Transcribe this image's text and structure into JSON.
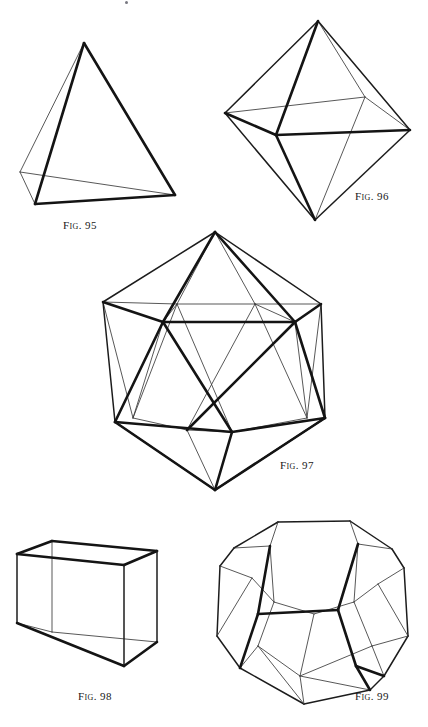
{
  "page": {
    "background_color": "#ffffff",
    "ink_color": "#141414",
    "width": 428,
    "height": 727,
    "medium": "line-engraving"
  },
  "figures": [
    {
      "id": "fig-95",
      "caption": "FIG. 95",
      "caption_prefix": "Fig.",
      "caption_number": "95",
      "solid_name": "tetrahedron",
      "faces": 4,
      "edges": 6,
      "vertices": 4,
      "face_polygon": "triangle"
    },
    {
      "id": "fig-96",
      "caption": "FIG. 96",
      "caption_prefix": "Fig.",
      "caption_number": "96",
      "solid_name": "octahedron",
      "faces": 8,
      "edges": 12,
      "vertices": 6,
      "face_polygon": "triangle"
    },
    {
      "id": "fig-97",
      "caption": "FIG. 97",
      "caption_prefix": "Fig.",
      "caption_number": "97",
      "solid_name": "icosahedron",
      "faces": 20,
      "edges": 30,
      "vertices": 12,
      "face_polygon": "triangle"
    },
    {
      "id": "fig-98",
      "caption": "FIG. 98",
      "caption_prefix": "Fig.",
      "caption_number": "98",
      "solid_name": "hexahedron",
      "faces": 6,
      "edges": 12,
      "vertices": 8,
      "face_polygon": "square"
    },
    {
      "id": "fig-99",
      "caption": "FIG. 99",
      "caption_prefix": "Fig.",
      "caption_number": "99",
      "solid_name": "dodecahedron",
      "faces": 12,
      "edges": 30,
      "vertices": 20,
      "face_polygon": "pentagon"
    }
  ]
}
